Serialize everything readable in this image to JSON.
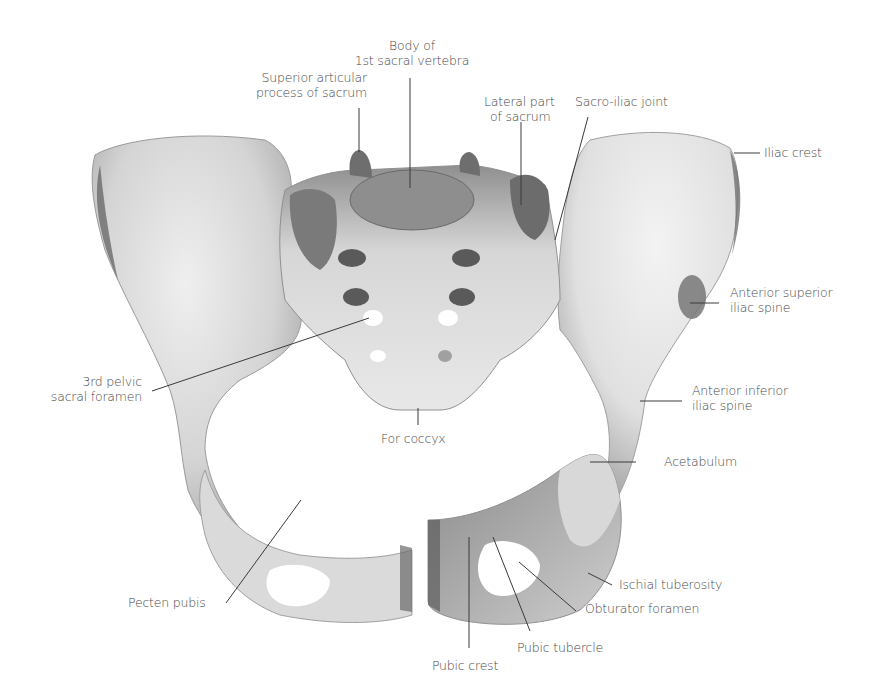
{
  "figure": {
    "colors": {
      "bone_light": "#e6e6e6",
      "bone_mid": "#c9c9c9",
      "bone_dark": "#8c8c8c",
      "bone_darkest": "#5e5e5e",
      "leader_line": "#3a3a3a",
      "label_text": "#4a4a4a",
      "background": "#ffffff"
    }
  },
  "labels": {
    "body_s1": {
      "line1": "Body of",
      "line2": "1st sacral vertebra"
    },
    "sup_articular": {
      "line1": "Superior articular",
      "line2": "process of sacrum"
    },
    "lateral_sacrum": {
      "line1": "Lateral part",
      "line2": "of sacrum"
    },
    "sacroiliac": {
      "line1": "Sacro-iliac joint"
    },
    "iliac_crest": {
      "line1": "Iliac crest"
    },
    "asis": {
      "line1": "Anterior superior",
      "line2": "iliac spine"
    },
    "aiis": {
      "line1": "Anterior inferior",
      "line2": "iliac spine"
    },
    "acetabulum": {
      "line1": "Acetabulum"
    },
    "third_foramen": {
      "line1": "3rd pelvic",
      "line2": "sacral foramen"
    },
    "coccyx": {
      "line1": "For coccyx"
    },
    "pecten_pubis": {
      "line1": "Pecten pubis"
    },
    "ischial_tuberosity": {
      "line1": "Ischial tuberosity"
    },
    "obturator_foramen": {
      "line1": "Obturator foramen"
    },
    "pubic_tubercle": {
      "line1": "Pubic tubercle"
    },
    "pubic_crest": {
      "line1": "Pubic crest"
    }
  }
}
